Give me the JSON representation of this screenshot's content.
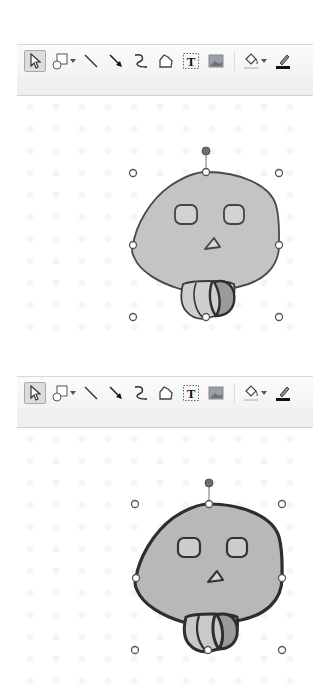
{
  "toolbar": {
    "tools": [
      {
        "name": "select",
        "icon": "pointer-arrow-icon",
        "active": true
      },
      {
        "name": "basic-shapes",
        "icon": "shapes-icon",
        "has_dropdown": true
      },
      {
        "name": "line",
        "icon": "line-icon"
      },
      {
        "name": "arrow",
        "icon": "arrow-icon"
      },
      {
        "name": "curve",
        "icon": "curve-icon"
      },
      {
        "name": "polygon",
        "icon": "polygon-icon"
      },
      {
        "name": "text",
        "icon": "text-box-icon",
        "label": "T"
      },
      {
        "name": "image",
        "icon": "image-icon"
      },
      {
        "name": "fill-color",
        "icon": "paint-bucket-icon",
        "has_dropdown": true
      },
      {
        "name": "line-color",
        "icon": "pen-icon"
      }
    ]
  },
  "panels": [
    {
      "id": "before",
      "shape": "skull",
      "outline_weight": "thin",
      "colors": {
        "fill": "#c4c4c4",
        "outline": "#4a4a4a",
        "eye_fill": "#d2d2d2",
        "jaw_dark": "#9a9a9a"
      }
    },
    {
      "id": "after",
      "shape": "skull",
      "outline_weight": "thick",
      "colors": {
        "fill": "#b8b8b8",
        "outline": "#2e2e2e",
        "eye_fill": "#cdcdcd",
        "jaw_dark": "#9a9a9a"
      }
    }
  ],
  "colors": {
    "toolbar_bg": "#f5f5f5",
    "subbar_bg": "#efefef",
    "active_tool_bg": "#dcdcdc",
    "handle_fill": "#ffffff",
    "handle_stroke": "#555555",
    "rotation_handle": "#6e6e6e"
  }
}
